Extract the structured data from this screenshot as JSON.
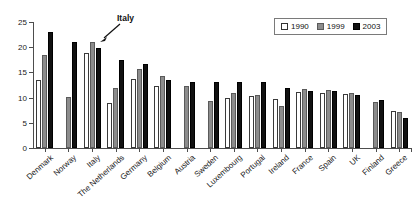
{
  "chart_data": {
    "type": "bar",
    "title": "",
    "xlabel": "",
    "ylabel": "",
    "ylim": [
      0,
      25
    ],
    "yticks": [
      0,
      5,
      10,
      15,
      20,
      25
    ],
    "grid": false,
    "legend_position": "top-right",
    "categories": [
      "Denmark",
      "Norway",
      "Italy",
      "The Netherlands",
      "Germany",
      "Belgium",
      "Austria",
      "Sweden",
      "Luxembourg",
      "Portugal",
      "Ireland",
      "France",
      "Spain",
      "UK",
      "Finland",
      "Greece"
    ],
    "series": [
      {
        "name": "1990",
        "color": "#ffffff",
        "values": [
          13.4,
          null,
          18.8,
          9.0,
          13.7,
          12.3,
          null,
          null,
          10.0,
          10.3,
          9.7,
          11.2,
          11.0,
          10.8,
          null,
          7.3
        ]
      },
      {
        "name": "1999",
        "color": "#8c8c8c",
        "values": [
          18.4,
          10.2,
          21.0,
          12.0,
          15.6,
          14.2,
          12.4,
          9.4,
          11.0,
          10.6,
          8.3,
          11.7,
          11.6,
          10.9,
          9.2,
          7.1
        ]
      },
      {
        "name": "2003",
        "color": "#111111",
        "values": [
          23.0,
          21.0,
          19.8,
          17.4,
          16.6,
          13.4,
          13.1,
          13.0,
          13.0,
          13.1,
          11.9,
          11.3,
          11.3,
          10.5,
          9.5,
          6.0
        ]
      }
    ],
    "annotations": [
      {
        "text": "Italy",
        "target_category": "Italy",
        "target_series": "2003"
      }
    ]
  },
  "legend": {
    "items": [
      {
        "label": "1990",
        "swatch": "white-square-swatch"
      },
      {
        "label": "1999",
        "swatch": "gray-square-swatch"
      },
      {
        "label": "2003",
        "swatch": "black-square-swatch"
      }
    ]
  }
}
